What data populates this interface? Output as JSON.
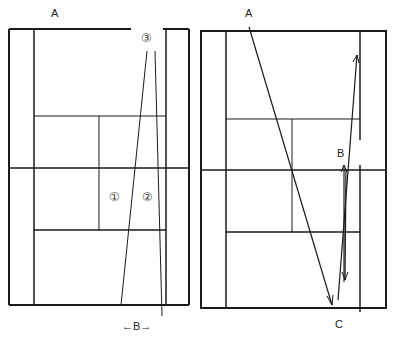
{
  "diagram": {
    "panels": [
      {
        "name": "left-court",
        "labels": {
          "a": "A",
          "circle3": "③",
          "circle1": "①",
          "circle2": "②",
          "b": "←B→"
        }
      },
      {
        "name": "right-court",
        "labels": {
          "a": "A",
          "b": "B",
          "c": "C"
        }
      }
    ],
    "colors": {
      "line": "#1a1a1a",
      "background": "#ffffff"
    }
  }
}
